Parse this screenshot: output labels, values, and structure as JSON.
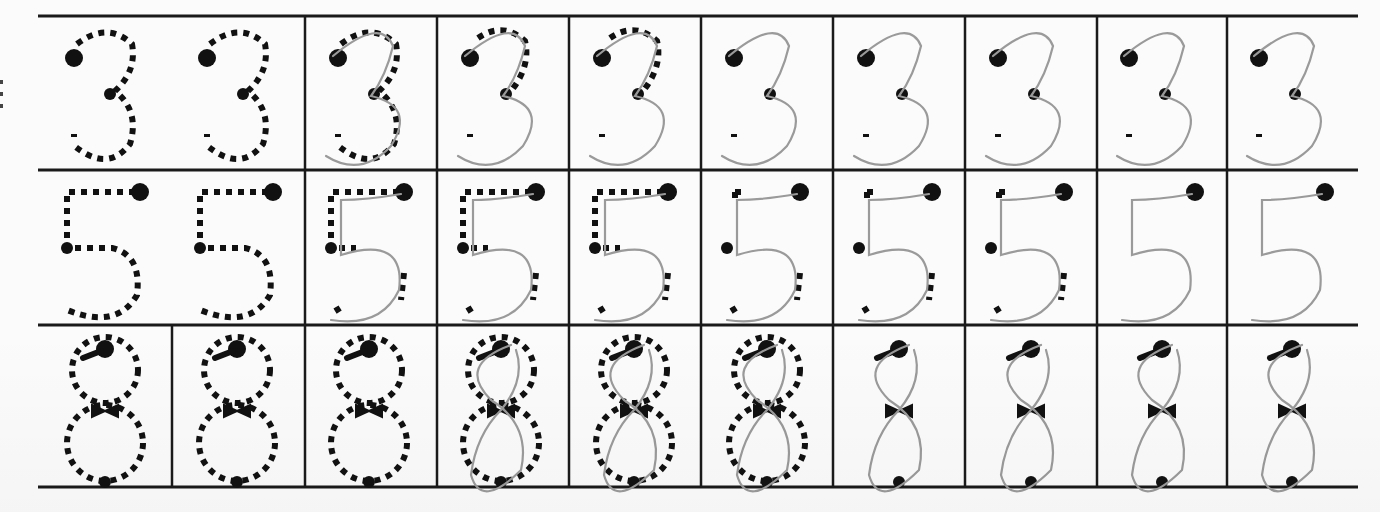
{
  "worksheet": {
    "title": "",
    "background": "#fbfbfb",
    "line_color": "#1a1a1a",
    "guide_color": "#111111",
    "trace_color": "#9a9a9a",
    "grid": {
      "left": 38,
      "right": 1358,
      "row_lines_y": [
        16,
        170,
        325,
        487
      ],
      "column_lines_x": [
        305,
        437,
        569,
        701,
        833,
        965,
        1097,
        1227
      ],
      "extra_column_lines": [
        {
          "row": 2,
          "x": 172
        }
      ]
    },
    "rows": [
      {
        "digit": "3",
        "cells": [
          {
            "cx": 107,
            "guide": "full",
            "trace": false
          },
          {
            "cx": 240,
            "guide": "full",
            "trace": false
          },
          {
            "cx": 371,
            "guide": "full",
            "trace": true
          },
          {
            "cx": 503,
            "guide": "partial",
            "trace": true
          },
          {
            "cx": 635,
            "guide": "partial",
            "trace": true
          },
          {
            "cx": 767,
            "guide": "anchors",
            "trace": true
          },
          {
            "cx": 899,
            "guide": "anchors",
            "trace": true
          },
          {
            "cx": 1031,
            "guide": "anchors",
            "trace": true
          },
          {
            "cx": 1162,
            "guide": "anchors",
            "trace": true
          },
          {
            "cx": 1292,
            "guide": "anchors",
            "trace": true
          }
        ]
      },
      {
        "digit": "5",
        "cells": [
          {
            "cx": 107,
            "guide": "full",
            "trace": false
          },
          {
            "cx": 240,
            "guide": "full",
            "trace": false
          },
          {
            "cx": 371,
            "guide": "partial",
            "trace": true
          },
          {
            "cx": 503,
            "guide": "partial",
            "trace": true
          },
          {
            "cx": 635,
            "guide": "partial",
            "trace": true
          },
          {
            "cx": 767,
            "guide": "minimal",
            "trace": true
          },
          {
            "cx": 899,
            "guide": "minimal",
            "trace": true
          },
          {
            "cx": 1031,
            "guide": "minimal",
            "trace": true
          },
          {
            "cx": 1162,
            "guide": "anchors",
            "trace": true
          },
          {
            "cx": 1292,
            "guide": "anchors",
            "trace": true
          }
        ]
      },
      {
        "digit": "8",
        "cells": [
          {
            "cx": 105,
            "guide": "full",
            "trace": false
          },
          {
            "cx": 237,
            "guide": "full",
            "trace": false
          },
          {
            "cx": 369,
            "guide": "full",
            "trace": false
          },
          {
            "cx": 501,
            "guide": "full",
            "trace": true
          },
          {
            "cx": 634,
            "guide": "full",
            "trace": true
          },
          {
            "cx": 767,
            "guide": "full",
            "trace": true
          },
          {
            "cx": 899,
            "guide": "anchors",
            "trace": true
          },
          {
            "cx": 1031,
            "guide": "anchors",
            "trace": true
          },
          {
            "cx": 1162,
            "guide": "anchors",
            "trace": true
          },
          {
            "cx": 1292,
            "guide": "anchors",
            "trace": true
          }
        ]
      }
    ]
  }
}
